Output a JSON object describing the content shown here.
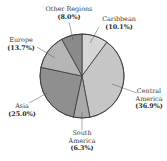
{
  "chart_data": {
    "type": "pie",
    "title": "",
    "start_angle_deg": 0,
    "direction": "clockwise",
    "slices": [
      {
        "label": "Caribbean",
        "value": 10.1,
        "display": "(10.1%)",
        "color": "#d6d6d6"
      },
      {
        "label": "Central America",
        "value": 36.9,
        "display": "(36.9%)",
        "color": "#c6c6c6"
      },
      {
        "label": "South America",
        "value": 6.3,
        "display": "(6.3%)",
        "color": "#a9a9a9"
      },
      {
        "label": "Asia",
        "value": 25.0,
        "display": "(25.0%)",
        "color": "#8f8f8f"
      },
      {
        "label": "Europe",
        "value": 13.7,
        "display": "(13.7%)",
        "color": "#b5b5b5"
      },
      {
        "label": "Other Regions",
        "value": 8.0,
        "display": "(8.0%)",
        "color": "#8a8a8a"
      }
    ],
    "labels": {
      "caribbean": {
        "line1": "Caribbean",
        "pct": "(10.1%)"
      },
      "central_america": {
        "line1": "Central",
        "line2": "America",
        "pct": "(36.9%)"
      },
      "south_america": {
        "line1": "South",
        "line2": "America",
        "pct": "(6.3%)"
      },
      "asia": {
        "line1": "Asia",
        "pct": "(25.0%)"
      },
      "europe": {
        "line1": "Europe",
        "pct": "(13.7%)"
      },
      "other_regions": {
        "line1": "Other Regions",
        "pct": "(8.0%)"
      }
    },
    "legend": "none (direct labels with leader lines)"
  }
}
